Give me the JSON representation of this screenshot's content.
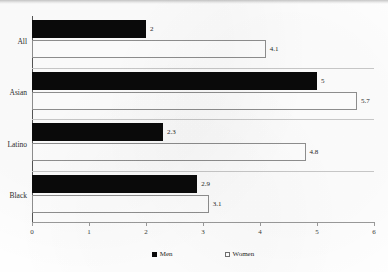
{
  "chart_data": {
    "type": "bar",
    "orientation": "horizontal",
    "title": "",
    "xlabel": "",
    "ylabel": "",
    "categories": [
      "All",
      "Asian",
      "Latino",
      "Black"
    ],
    "series": [
      {
        "name": "Men",
        "values": [
          2,
          5,
          2.3,
          2.9
        ],
        "color": "#0a0a0a",
        "style": "filled"
      },
      {
        "name": "Women",
        "values": [
          4.1,
          5.7,
          4.8,
          3.1
        ],
        "color": "#ffffff",
        "style": "outlined"
      }
    ],
    "value_labels": {
      "All": {
        "Men": "2",
        "Women": "4.1"
      },
      "Asian": {
        "Men": "5",
        "Women": "5.7"
      },
      "Latino": {
        "Men": "2.3",
        "Women": "4.8"
      },
      "Black": {
        "Men": "2.9",
        "Women": "3.1"
      }
    },
    "xlim": [
      0,
      6
    ],
    "xticks": [
      "0",
      "1",
      "2",
      "3",
      "4",
      "5",
      "6"
    ],
    "grid": false,
    "legend_position": "bottom"
  }
}
